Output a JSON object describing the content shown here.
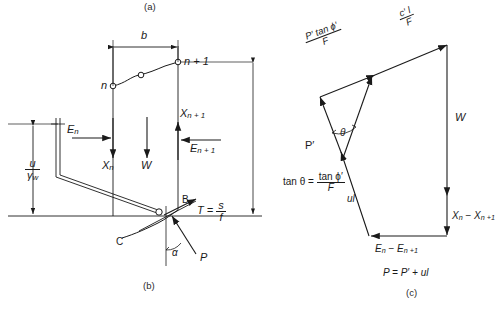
{
  "figure": {
    "panel_labels": {
      "a": "(a)",
      "b": "(b)",
      "c": "(c)"
    },
    "stroke_color": "#1a1a1a",
    "background": "#ffffff"
  },
  "panel_b": {
    "name": "slice-free-body-diagram",
    "slice_width_label": "b",
    "node_n_label": "n",
    "node_n1_label": "n + 1",
    "weight_label": "W",
    "force_En_label": "E",
    "force_En_sub": "n",
    "force_Xn_label": "X",
    "force_Xn_sub": "n",
    "force_En1_label": "E",
    "force_En1_sub": "n + 1",
    "force_Xn1_label": "X",
    "force_Xn1_sub": "n + 1",
    "piezo_head_num": "u",
    "piezo_head_den": "γ",
    "piezo_head_den_sub": "w",
    "point_B_label": "B",
    "point_C_label": "C",
    "shear_label_lhs": "T = ",
    "shear_num": "s",
    "shear_den": "f",
    "angle_label": "α",
    "force_P_label": "P"
  },
  "panel_c": {
    "name": "force-polygon",
    "vector_cohesion_num": "c′ l",
    "vector_cohesion_den": "F",
    "vector_friction_num": "P′ tan ϕ′",
    "vector_friction_den": "F",
    "vector_W_label": "W",
    "vector_P_prime_label": "P′",
    "vector_ul_label": "ul",
    "theta_label": "θ",
    "vector_X_diff_label_a": "X",
    "vector_X_diff_sub_a": "n",
    "vector_X_diff_dash": " − ",
    "vector_X_diff_label_b": "X",
    "vector_X_diff_sub_b": "n +1",
    "vector_E_diff_label_a": "E",
    "vector_E_diff_sub_a": "n",
    "vector_E_diff_dash": " − ",
    "vector_E_diff_label_b": "E",
    "vector_E_diff_sub_b": "n +1",
    "eq_tan_theta_lhs": "tan θ = ",
    "eq_tan_theta_num": "tan ϕ′",
    "eq_tan_theta_den": "F",
    "eq_P_definition": "P = P′ + ul"
  }
}
